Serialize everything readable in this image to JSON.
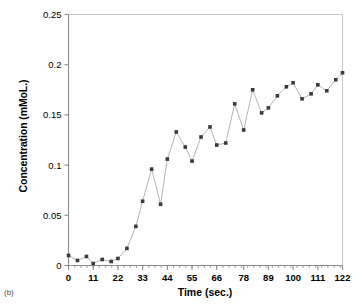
{
  "figure": {
    "panel_caption": "(b)",
    "marker_color": "#3a3a3a",
    "line_color": "#b4b4b4",
    "axis_color": "#8c8c8c",
    "text_color": "#000000"
  },
  "chart_data": {
    "type": "scatter",
    "title": "",
    "subtitle": "",
    "xlabel": "Time (sec.)",
    "ylabel": "Concentration (mMoL.)",
    "xlim": [
      0,
      122
    ],
    "ylim": [
      0,
      0.25
    ],
    "grid": false,
    "legend": null,
    "connected": true,
    "marker": "square",
    "xticks": [
      0,
      11,
      22,
      33,
      44,
      55,
      66,
      78,
      89,
      100,
      111,
      122
    ],
    "xtick_labels": [
      "0",
      "11",
      "22",
      "33",
      "44",
      "55",
      "66",
      "78",
      "89",
      "100",
      "111",
      "122"
    ],
    "x_minor_tick_step": 2.75,
    "yticks": [
      0,
      0.05,
      0.1,
      0.15,
      0.2,
      0.25
    ],
    "ytick_labels": [
      "0",
      "0.05",
      "0.1",
      "0.15",
      "0.2",
      "0.25"
    ],
    "series": [
      {
        "name": "Concentration",
        "x": [
          0,
          4,
          8,
          11,
          15,
          19,
          22,
          26,
          30,
          33,
          37,
          41,
          44,
          48,
          52,
          55,
          59,
          63,
          66,
          70,
          74,
          78,
          82,
          86,
          89,
          93,
          97,
          100,
          104,
          108,
          111,
          115,
          119,
          122
        ],
        "y": [
          0.01,
          0.005,
          0.009,
          0.002,
          0.006,
          0.004,
          0.007,
          0.017,
          0.039,
          0.064,
          0.096,
          0.061,
          0.106,
          0.133,
          0.118,
          0.104,
          0.128,
          0.138,
          0.12,
          0.122,
          0.161,
          0.135,
          0.175,
          0.152,
          0.157,
          0.169,
          0.178,
          0.182,
          0.166,
          0.171,
          0.18,
          0.174,
          0.185,
          0.192
        ]
      }
    ]
  }
}
